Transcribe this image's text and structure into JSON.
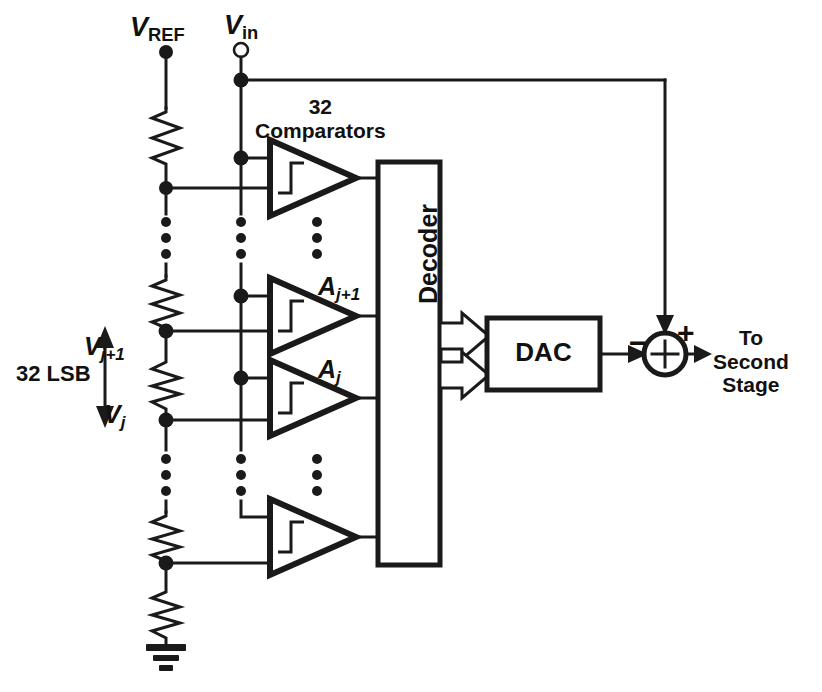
{
  "figure": {
    "colors": {
      "ink": "#1a1a1a",
      "background": "#ffffff"
    }
  },
  "labels": {
    "vref": {
      "symbol": "V",
      "subscript": "REF"
    },
    "vin": {
      "symbol": "V",
      "subscript": "in"
    },
    "comparators_count": "32",
    "comparators_word": "Comparators",
    "amp_j_plus_1": {
      "symbol": "A",
      "subscript": "j+1"
    },
    "amp_j": {
      "symbol": "A",
      "subscript": "j"
    },
    "v_j_plus_1": {
      "symbol": "V",
      "subscript": "j+1"
    },
    "v_j": {
      "symbol": "V",
      "subscript": "j"
    },
    "span_annotation": "32 LSB",
    "decoder": "Decoder",
    "dac": "DAC",
    "sum_minus": "−",
    "sum_plus": "+",
    "output_line1": "To",
    "output_line2": "Second",
    "output_line3": "Stage"
  },
  "blocks": [
    {
      "name": "decoder",
      "label": "Decoder",
      "x": 378,
      "y": 162,
      "w": 62,
      "h": 403
    },
    {
      "name": "dac",
      "label": "DAC",
      "x": 487,
      "y": 318,
      "w": 113,
      "h": 72
    }
  ],
  "comparators": [
    {
      "name": "comparator-top",
      "label": "",
      "x": 270,
      "y": 140,
      "w": 86,
      "h": 76
    },
    {
      "name": "comparator-j-plus-1",
      "label": "A j+1",
      "x": 270,
      "y": 278,
      "w": 86,
      "h": 76
    },
    {
      "name": "comparator-j",
      "label": "A j",
      "x": 270,
      "y": 360,
      "w": 86,
      "h": 76
    },
    {
      "name": "comparator-bottom",
      "label": "",
      "x": 270,
      "y": 499,
      "w": 86,
      "h": 76
    }
  ],
  "ladder": {
    "rail_x": 166,
    "top_y": 52,
    "bottom_y": 645,
    "resistor_count_visible": 5,
    "tap_nodes": [
      {
        "name": "tap-top",
        "y": 188
      },
      {
        "name": "tap-j-plus-1",
        "y": 331,
        "label": "V j+1"
      },
      {
        "name": "tap-j",
        "y": 420,
        "label": "V j"
      },
      {
        "name": "tap-bottom",
        "y": 563
      }
    ],
    "ground": {
      "x": 166,
      "y": 645
    }
  },
  "signal_path": {
    "vin_x": 241,
    "feedback_x": 665,
    "sum_node": {
      "x": 665,
      "y": 354,
      "r": 21
    },
    "output_arrow_to": 706
  },
  "ellipses": [
    {
      "name": "ellipsis-upper-ladder",
      "x": 166,
      "y_start": 220,
      "count": 3
    },
    {
      "name": "ellipsis-upper-vin",
      "x": 241,
      "y_start": 220,
      "count": 3
    },
    {
      "name": "ellipsis-upper-comparators",
      "x": 317,
      "y_start": 220,
      "count": 3
    },
    {
      "name": "ellipsis-lower-ladder",
      "x": 166,
      "y_start": 457,
      "count": 3
    },
    {
      "name": "ellipsis-lower-vin",
      "x": 241,
      "y_start": 457,
      "count": 3
    },
    {
      "name": "ellipsis-lower-comparators",
      "x": 317,
      "y_start": 457,
      "count": 3
    }
  ]
}
